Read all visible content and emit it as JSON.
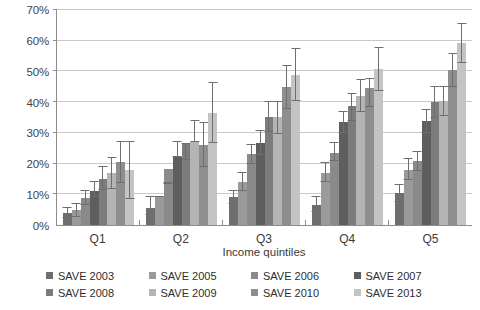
{
  "chart_data": {
    "type": "bar",
    "title": "",
    "subtitle": "",
    "xlabel": "Income quintiles",
    "ylabel": "",
    "ylim": [
      0,
      70
    ],
    "ytick_labels": [
      "0%",
      "10%",
      "20%",
      "30%",
      "40%",
      "50%",
      "60%",
      "70%"
    ],
    "ytick_values": [
      0,
      10,
      20,
      30,
      40,
      50,
      60,
      70
    ],
    "grid": true,
    "legend_position": "bottom",
    "error_bars": true,
    "categories": [
      "Q1",
      "Q2",
      "Q3",
      "Q4",
      "Q5"
    ],
    "series": [
      {
        "name": "SAVE 2003",
        "color": "#6e6e6e",
        "values": [
          4.0,
          5.6,
          9.1,
          6.5,
          10.4
        ],
        "err_low": [
          2.4,
          3.4,
          7.0,
          4.4,
          7.5
        ],
        "err_high": [
          5.8,
          9.3,
          11.4,
          9.3,
          13.4
        ]
      },
      {
        "name": "SAVE 2005",
        "color": "#9a9a9a",
        "values": [
          4.8,
          9.2,
          13.9,
          17.0,
          18.0
        ],
        "err_low": [
          2.7,
          9.2,
          11.2,
          14.0,
          14.8
        ],
        "err_high": [
          7.2,
          9.2,
          17.3,
          20.5,
          21.9
        ]
      },
      {
        "name": "SAVE 2006",
        "color": "#8a8a8a",
        "values": [
          8.7,
          18.1,
          23.1,
          23.6,
          20.8
        ],
        "err_low": [
          6.6,
          13.6,
          19.9,
          21.0,
          17.6
        ],
        "err_high": [
          11.4,
          13.6,
          26.4,
          27.1,
          24.2
        ]
      },
      {
        "name": "SAVE 2007",
        "color": "#5e5e5e",
        "values": [
          11.2,
          22.1,
          26.8,
          33.6,
          33.8
        ],
        "err_low": [
          9.0,
          22.1,
          22.8,
          30.0,
          29.9
        ],
        "err_high": [
          14.2,
          27.5,
          30.8,
          37.0,
          37.8
        ]
      },
      {
        "name": "SAVE 2008",
        "color": "#7c7c7c",
        "values": [
          14.9,
          26.6,
          35.2,
          38.8,
          40.2
        ],
        "err_low": [
          11.5,
          21.2,
          30.2,
          34.0,
          34.9
        ],
        "err_high": [
          19.2,
          26.6,
          40.3,
          43.1,
          45.2
        ]
      },
      {
        "name": "SAVE 2009",
        "color": "#b4b4b4",
        "values": [
          17.0,
          26.9,
          35.3,
          42.1,
          40.5
        ],
        "err_low": [
          11.7,
          26.9,
          29.6,
          36.8,
          35.6
        ],
        "err_high": [
          22.3,
          34.2,
          40.4,
          47.7,
          45.3
        ]
      },
      {
        "name": "SAVE 2010",
        "color": "#8e8e8e",
        "values": [
          20.5,
          26.0,
          45.0,
          44.7,
          50.5
        ],
        "err_low": [
          13.7,
          18.9,
          37.8,
          38.5,
          44.8
        ],
        "err_high": [
          27.3,
          33.5,
          52.0,
          48.0,
          56.0
        ]
      },
      {
        "name": "SAVE 2013",
        "color": "#c4c4c4",
        "values": [
          17.8,
          36.6,
          49.0,
          50.8,
          59.2
        ],
        "err_low": [
          8.5,
          26.6,
          40.4,
          43.7,
          52.7
        ],
        "err_high": [
          27.4,
          46.7,
          57.7,
          57.8,
          65.7
        ]
      }
    ]
  },
  "legend": {
    "items": [
      {
        "label": "SAVE 2003",
        "color": "#6e6e6e"
      },
      {
        "label": "SAVE 2005",
        "color": "#9a9a9a"
      },
      {
        "label": "SAVE 2006",
        "color": "#8a8a8a"
      },
      {
        "label": "SAVE 2007",
        "color": "#5e5e5e"
      },
      {
        "label": "SAVE 2008",
        "color": "#7c7c7c"
      },
      {
        "label": "SAVE 2009",
        "color": "#b4b4b4"
      },
      {
        "label": "SAVE 2010",
        "color": "#8e8e8e"
      },
      {
        "label": "SAVE 2013",
        "color": "#c4c4c4"
      }
    ]
  },
  "axes": {
    "x_title": "Income quintiles"
  }
}
